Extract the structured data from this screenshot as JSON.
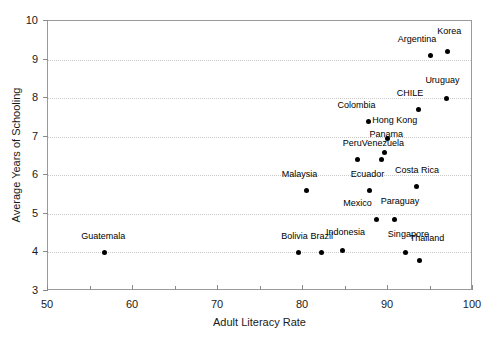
{
  "chart_data": {
    "type": "scatter",
    "title": "",
    "xlabel": "Adult Literacy Rate",
    "ylabel": "Average Years of Schooling",
    "xlim": [
      50,
      100
    ],
    "ylim": [
      3,
      10
    ],
    "xticks": [
      50,
      60,
      70,
      80,
      90,
      100
    ],
    "xticks_minor": [
      55,
      65,
      75,
      85,
      95
    ],
    "yticks": [
      3,
      4,
      5,
      6,
      7,
      8,
      9,
      10
    ],
    "grid": "horizontal-dotted",
    "legend": "none",
    "marker_color": "#000000",
    "points": [
      {
        "label": "Guatemala",
        "x": 56.7,
        "y": 4.0,
        "lx": 56.5,
        "ly": 4.3
      },
      {
        "label": "Malaysia",
        "x": 80.4,
        "y": 5.6,
        "lx": 79.6,
        "ly": 5.9
      },
      {
        "label": "Bolivia",
        "x": 79.5,
        "y": 4.0,
        "lx": 79.0,
        "ly": 4.3
      },
      {
        "label": "Brazil",
        "x": 82.2,
        "y": 4.0,
        "lx": 82.2,
        "ly": 4.3
      },
      {
        "label": "Indonesia",
        "x": 84.6,
        "y": 4.05,
        "lx": 85.0,
        "ly": 4.4
      },
      {
        "label": "Peru",
        "x": 86.4,
        "y": 6.4,
        "lx": 85.8,
        "ly": 6.7
      },
      {
        "label": "Colombia",
        "x": 87.7,
        "y": 7.4,
        "lx": 86.3,
        "ly": 7.7
      },
      {
        "label": "Venezuela",
        "x": 89.2,
        "y": 6.4,
        "lx": 89.4,
        "ly": 6.7
      },
      {
        "label": "Hong Kong",
        "x": 89.9,
        "y": 6.95,
        "lx": 90.8,
        "ly": 7.3
      },
      {
        "label": "Panama",
        "x": 89.6,
        "y": 6.6,
        "lx": 89.8,
        "ly": 6.95
      },
      {
        "label": "Ecuador",
        "x": 87.8,
        "y": 5.6,
        "lx": 87.6,
        "ly": 5.9
      },
      {
        "label": "Mexico",
        "x": 88.6,
        "y": 4.85,
        "lx": 86.4,
        "ly": 5.15
      },
      {
        "label": "Paraguay",
        "x": 90.8,
        "y": 4.85,
        "lx": 91.4,
        "ly": 5.2
      },
      {
        "label": "Singapore",
        "x": 92.1,
        "y": 4.0,
        "lx": 92.4,
        "ly": 4.35
      },
      {
        "label": "Thailand",
        "x": 93.7,
        "y": 3.8,
        "lx": 94.6,
        "ly": 4.25
      },
      {
        "label": "Costa Rica",
        "x": 93.3,
        "y": 5.7,
        "lx": 93.4,
        "ly": 6.0
      },
      {
        "label": "CHILE",
        "x": 93.6,
        "y": 7.7,
        "lx": 92.6,
        "ly": 8.0
      },
      {
        "label": "Uruguay",
        "x": 96.9,
        "y": 8.0,
        "lx": 96.4,
        "ly": 8.35
      },
      {
        "label": "Argentina",
        "x": 95.0,
        "y": 9.1,
        "lx": 93.4,
        "ly": 9.4
      },
      {
        "label": "Korea",
        "x": 97.0,
        "y": 9.2,
        "lx": 97.2,
        "ly": 9.6
      }
    ]
  }
}
